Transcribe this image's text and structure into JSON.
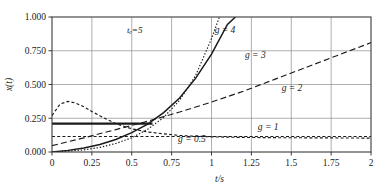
{
  "chart_data": {
    "type": "line",
    "title": "",
    "xlabel": "t/s",
    "ylabel": "x(t)",
    "xlim": [
      0,
      2
    ],
    "ylim": [
      0,
      1
    ],
    "grid": true,
    "legend": "inline-annotations",
    "xticks": [
      "0",
      "0.25",
      "0.5",
      "0.75",
      "1",
      "1.25",
      "1.5",
      "1.75",
      "2"
    ],
    "xtick_values": [
      0,
      0.25,
      0.5,
      0.75,
      1,
      1.25,
      1.5,
      1.75,
      2
    ],
    "yticks": [
      "0.000",
      "0.250",
      "0.500",
      "0.750",
      "1.000"
    ],
    "ytick_values": [
      0,
      0.25,
      0.5,
      0.75,
      1
    ],
    "annotations": [
      {
        "name": "tc-annotation",
        "text": "tₑ=5",
        "x": 0.47,
        "y": 0.88
      },
      {
        "name": "threshold-line-note",
        "text": "",
        "x": 0,
        "y": 0.21
      }
    ],
    "reference_line": {
      "name": "threshold",
      "style": "solid-thick",
      "y": 0.21,
      "x_start": 0.0,
      "x_end": 0.63
    },
    "series": [
      {
        "name": "g = 4",
        "label": "g = 4",
        "style": "dotted",
        "label_x": 1.02,
        "label_y": 0.885,
        "x": [
          0,
          0.1,
          0.2,
          0.3,
          0.4,
          0.5,
          0.6,
          0.7,
          0.8,
          0.9,
          1.0,
          1.05
        ],
        "y": [
          0.0,
          0.006,
          0.016,
          0.034,
          0.063,
          0.105,
          0.168,
          0.256,
          0.383,
          0.565,
          0.84,
          1.0
        ]
      },
      {
        "name": "g = 3",
        "label": "g = 3",
        "style": "solid",
        "label_x": 1.21,
        "label_y": 0.7,
        "x": [
          0,
          0.1,
          0.2,
          0.3,
          0.4,
          0.5,
          0.6,
          0.7,
          0.8,
          0.9,
          1.0,
          1.1,
          1.15
        ],
        "y": [
          0.0,
          0.012,
          0.03,
          0.056,
          0.093,
          0.143,
          0.207,
          0.292,
          0.4,
          0.545,
          0.725,
          0.945,
          1.0
        ]
      },
      {
        "name": "g = 2",
        "label": "g = 2",
        "style": "dashed-long",
        "label_x": 1.44,
        "label_y": 0.455,
        "x": [
          0,
          0.2,
          0.4,
          0.6,
          0.8,
          1.0,
          1.2,
          1.4,
          1.6,
          1.8,
          2.0
        ],
        "y": [
          0.047,
          0.105,
          0.166,
          0.228,
          0.296,
          0.37,
          0.45,
          0.54,
          0.63,
          0.72,
          0.81
        ]
      },
      {
        "name": "g = 1",
        "label": "g = 1",
        "style": "dashed-short",
        "label_x": 1.29,
        "label_y": 0.165,
        "x": [
          0,
          0.2,
          0.4,
          0.6,
          0.8,
          1.0,
          1.2,
          1.4,
          1.6,
          1.8,
          2.0
        ],
        "y": [
          0.115,
          0.115,
          0.115,
          0.115,
          0.115,
          0.115,
          0.115,
          0.115,
          0.115,
          0.115,
          0.115
        ]
      },
      {
        "name": "g = 0.5",
        "label": "g = 0.5",
        "style": "dashed-short",
        "label_x": 0.79,
        "label_y": 0.075,
        "x": [
          0,
          0.05,
          0.1,
          0.15,
          0.2,
          0.25,
          0.3,
          0.4,
          0.5,
          0.6,
          0.8,
          1.0,
          1.2,
          1.4,
          1.6,
          1.8,
          2.0
        ],
        "y": [
          0.27,
          0.355,
          0.375,
          0.362,
          0.335,
          0.3,
          0.268,
          0.21,
          0.172,
          0.148,
          0.122,
          0.112,
          0.108,
          0.106,
          0.105,
          0.104,
          0.103
        ]
      }
    ]
  }
}
